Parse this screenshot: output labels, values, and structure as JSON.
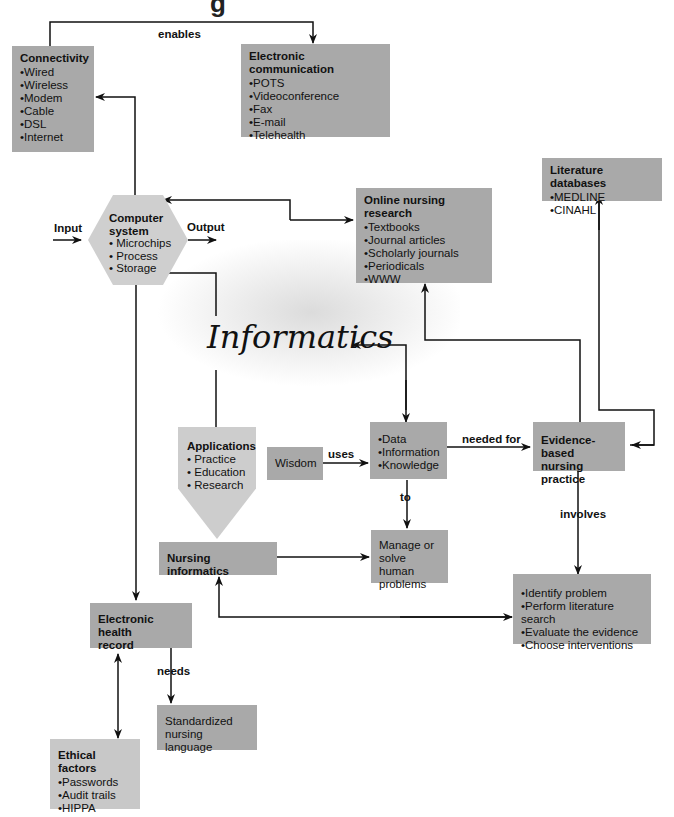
{
  "title_fragment": "g",
  "center_label": "Informatics",
  "nodes": {
    "connectivity": {
      "title": "Connectivity",
      "items": [
        "Wired",
        "Wireless",
        "Modem",
        "Cable",
        "DSL",
        "Internet"
      ]
    },
    "electronic_communication": {
      "title": "Electronic communication",
      "items": [
        "POTS",
        "Videoconference",
        "Fax",
        "E-mail",
        "Telehealth"
      ]
    },
    "computer_system": {
      "title_line1": "Computer",
      "title_line2": "system",
      "items": [
        "Microchips",
        "Process",
        "Storage"
      ]
    },
    "online_nursing_research": {
      "title": "Online nursing research",
      "items": [
        "Textbooks",
        "Journal articles",
        "Scholarly journals",
        "Periodicals",
        "WWW"
      ]
    },
    "literature_databases": {
      "title": "Literature databases",
      "items": [
        "MEDLINE",
        "CINAHL"
      ]
    },
    "applications": {
      "title": "Applications",
      "items": [
        "Practice",
        "Education",
        "Research"
      ]
    },
    "wisdom": {
      "label": "Wisdom"
    },
    "dik": {
      "items": [
        "Data",
        "Information",
        "Knowledge"
      ]
    },
    "evidence_based": {
      "line1": "Evidence-based",
      "line2": "nursing practice"
    },
    "nursing_informatics": {
      "label": "Nursing informatics"
    },
    "manage": {
      "line1": "Manage or",
      "line2": "solve human",
      "line3": "problems"
    },
    "ebp_steps": {
      "items": [
        "Identify problem",
        "Perform literature search",
        "Evaluate the evidence",
        "Choose interventions"
      ]
    },
    "ehr": {
      "line1": "Electronic health",
      "line2": "record"
    },
    "standardized": {
      "line1": "Standardized",
      "line2": "nursing language"
    },
    "ethical": {
      "title": "Ethical factors",
      "items": [
        "Passwords",
        "Audit trails",
        "HIPPA"
      ]
    }
  },
  "edge_labels": {
    "enables": "enables",
    "input": "Input",
    "output": "Output",
    "uses": "uses",
    "needed_for": "needed for",
    "to": "to",
    "involves": "involves",
    "needs": "needs"
  },
  "colors": {
    "box_dark": "#a9a9a9",
    "box_light": "#c8c8c8",
    "line": "#111111"
  }
}
